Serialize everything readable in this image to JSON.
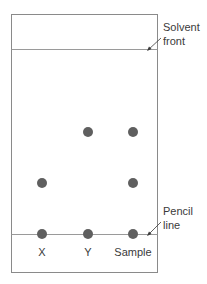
{
  "diagram": {
    "type": "paper-chromatogram",
    "colors": {
      "paper_border": "#8a8a8a",
      "line": "#9a9a9a",
      "spot": "#5f5f5f",
      "text": "#3a3a3a"
    },
    "annotations": {
      "solvent_front": {
        "line1": "Solvent",
        "line2": "front"
      },
      "pencil_line": {
        "line1": "Pencil",
        "line2": "line"
      }
    },
    "lanes": [
      {
        "label": "X",
        "spots": [
          "baseline",
          "lower"
        ]
      },
      {
        "label": "Y",
        "spots": [
          "baseline",
          "upper"
        ]
      },
      {
        "label": "Sample",
        "spots": [
          "baseline",
          "lower",
          "upper"
        ]
      }
    ]
  }
}
